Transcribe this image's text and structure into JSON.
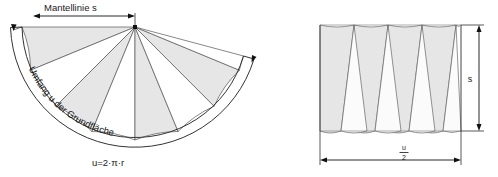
{
  "figure": {
    "title_note": "Cone lateral surface development",
    "colors": {
      "wedge_fill": "#e6e6e6",
      "wedge_stroke": "#555555",
      "outline": "#333333",
      "dimension": "#111111",
      "background": "#ffffff",
      "text": "#1a1a1a"
    }
  },
  "left_diagram": {
    "name": "unrolled-cone-sector",
    "slant_label": "Mantellinie s",
    "arc_label": "Umfang u der Grundfläche",
    "formula": "u=2·π·r",
    "wedge_count": 8
  },
  "right_diagram": {
    "name": "rearranged-wedges-rectangle",
    "height_label": "s",
    "width_label_numerator": "u",
    "width_label_denominator": "2",
    "triangle_count_up": 4,
    "triangle_count_down": 4
  }
}
